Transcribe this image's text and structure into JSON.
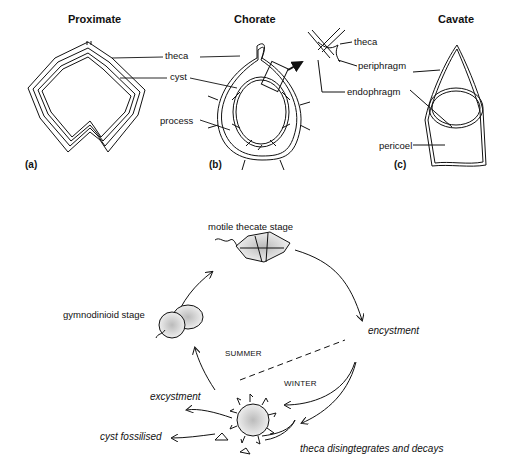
{
  "figure": {
    "top": {
      "panels": [
        {
          "id": "a",
          "title": "Proximate",
          "letter": "(a)"
        },
        {
          "id": "b",
          "title": "Chorate",
          "letter": "(b)"
        },
        {
          "id": "c",
          "title": "Cavate",
          "letter": "(c)"
        }
      ],
      "labels": {
        "theca": "theca",
        "cyst": "cyst",
        "process": "process",
        "detail_theca": "theca",
        "periphragm": "periphragm",
        "endophragm": "endophragm",
        "pericoel": "pericoel"
      }
    },
    "cycle": {
      "stages": {
        "motile": "motile thecate stage",
        "gymnodinioid": "gymnodinioid stage"
      },
      "processes": {
        "encystment": "encystment",
        "excystment": "excystment",
        "fossilised": "cyst fossilised",
        "decay": "theca disingtegrates and decays"
      },
      "seasons": {
        "summer": "SUMMER",
        "winter": "WINTER"
      }
    }
  }
}
